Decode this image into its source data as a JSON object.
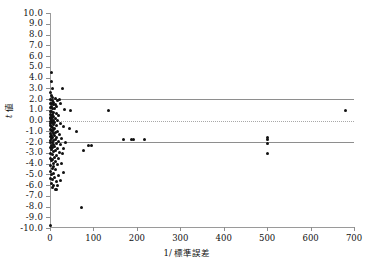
{
  "chart_data": {
    "type": "scatter",
    "title": "",
    "xlabel": "1/ 標準誤差",
    "ylabel": "t 値",
    "xlim": [
      0,
      700
    ],
    "ylim": [
      -10,
      10
    ],
    "xticks": [
      0,
      100,
      200,
      300,
      400,
      500,
      600,
      700
    ],
    "yticks": [
      10.0,
      9.0,
      8.0,
      7.0,
      6.0,
      5.0,
      4.0,
      3.0,
      2.0,
      1.0,
      0.0,
      -1.0,
      -2.0,
      -3.0,
      -4.0,
      -5.0,
      -6.0,
      -7.0,
      -8.0,
      -9.0,
      -10.0
    ],
    "xtick_labels": [
      "0",
      "100",
      "200",
      "300",
      "400",
      "500",
      "600",
      "700"
    ],
    "ytick_labels": [
      "10.0",
      "9.0",
      "8.0",
      "7.0",
      "6.0",
      "5.0",
      "4.0",
      "3.0",
      "2.0",
      "1.0",
      "0.0",
      "-1.0",
      "-2.0",
      "-3.0",
      "-4.0",
      "-5.0",
      "-6.0",
      "-7.0",
      "-8.0",
      "-9.0",
      "-10.0"
    ],
    "grid": false,
    "legend": null,
    "marker": "filled-circle",
    "marker_color": "#111111",
    "reference_lines": [
      {
        "name": "upper-significance-line",
        "y": 1.96,
        "style": "solid",
        "color": "#8e8e8e"
      },
      {
        "name": "zero-line",
        "y": 0.0,
        "style": "dotted",
        "color": "#a8a8a8"
      },
      {
        "name": "lower-significance-line",
        "y": -1.96,
        "style": "solid",
        "color": "#8e8e8e"
      }
    ],
    "points": [
      [
        3,
        4.5
      ],
      [
        4,
        3.6
      ],
      [
        5,
        3.0
      ],
      [
        28,
        3.0
      ],
      [
        2,
        2.6
      ],
      [
        3,
        2.3
      ],
      [
        6,
        2.1
      ],
      [
        13,
        2.05
      ],
      [
        21,
        2.0
      ],
      [
        2,
        1.95
      ],
      [
        5,
        1.9
      ],
      [
        17,
        1.85
      ],
      [
        9,
        1.7
      ],
      [
        1,
        1.6
      ],
      [
        4,
        1.55
      ],
      [
        12,
        1.5
      ],
      [
        24,
        1.6
      ],
      [
        7,
        1.45
      ],
      [
        3,
        1.35
      ],
      [
        16,
        1.3
      ],
      [
        2,
        1.2
      ],
      [
        6,
        1.15
      ],
      [
        11,
        1.1
      ],
      [
        34,
        1.05
      ],
      [
        46,
        0.95
      ],
      [
        135,
        0.9
      ],
      [
        681,
        0.95
      ],
      [
        1,
        0.85
      ],
      [
        4,
        0.8
      ],
      [
        8,
        0.75
      ],
      [
        14,
        0.7
      ],
      [
        2,
        0.6
      ],
      [
        5,
        0.55
      ],
      [
        20,
        0.5
      ],
      [
        3,
        0.45
      ],
      [
        9,
        0.4
      ],
      [
        1,
        0.3
      ],
      [
        6,
        0.25
      ],
      [
        12,
        0.2
      ],
      [
        2,
        0.15
      ],
      [
        4,
        0.1
      ],
      [
        18,
        0.05
      ],
      [
        7,
        0.0
      ],
      [
        1,
        -0.05
      ],
      [
        3,
        -0.1
      ],
      [
        10,
        -0.15
      ],
      [
        5,
        -0.2
      ],
      [
        23,
        -0.25
      ],
      [
        2,
        -0.3
      ],
      [
        8,
        -0.4
      ],
      [
        15,
        -0.45
      ],
      [
        1,
        -0.5
      ],
      [
        4,
        -0.55
      ],
      [
        30,
        -0.6
      ],
      [
        6,
        -0.65
      ],
      [
        11,
        -0.7
      ],
      [
        45,
        -0.75
      ],
      [
        2,
        -0.8
      ],
      [
        9,
        -0.85
      ],
      [
        3,
        -0.95
      ],
      [
        17,
        -1.0
      ],
      [
        60,
        -1.0
      ],
      [
        5,
        -1.05
      ],
      [
        13,
        -1.1
      ],
      [
        1,
        -1.2
      ],
      [
        7,
        -1.25
      ],
      [
        22,
        -1.3
      ],
      [
        4,
        -1.35
      ],
      [
        10,
        -1.4
      ],
      [
        2,
        -1.5
      ],
      [
        16,
        -1.55
      ],
      [
        6,
        -1.6
      ],
      [
        27,
        -1.65
      ],
      [
        3,
        -1.7
      ],
      [
        12,
        -1.75
      ],
      [
        170,
        -1.75
      ],
      [
        188,
        -1.8
      ],
      [
        193,
        -1.78
      ],
      [
        218,
        -1.8
      ],
      [
        500,
        -1.55
      ],
      [
        500,
        -1.75
      ],
      [
        1,
        -1.85
      ],
      [
        8,
        -1.9
      ],
      [
        19,
        -1.95
      ],
      [
        5,
        -2.0
      ],
      [
        35,
        -2.0
      ],
      [
        2,
        -2.05
      ],
      [
        14,
        -2.1
      ],
      [
        500,
        -2.15
      ],
      [
        9,
        -2.2
      ],
      [
        24,
        -2.25
      ],
      [
        4,
        -2.3
      ],
      [
        88,
        -2.35
      ],
      [
        95,
        -2.3
      ],
      [
        11,
        -2.4
      ],
      [
        1,
        -2.5
      ],
      [
        6,
        -2.55
      ],
      [
        18,
        -2.6
      ],
      [
        32,
        -2.6
      ],
      [
        3,
        -2.7
      ],
      [
        78,
        -2.75
      ],
      [
        13,
        -2.8
      ],
      [
        8,
        -2.9
      ],
      [
        22,
        -2.95
      ],
      [
        500,
        -3.05
      ],
      [
        2,
        -3.1
      ],
      [
        29,
        -3.1
      ],
      [
        5,
        -3.2
      ],
      [
        15,
        -3.25
      ],
      [
        10,
        -3.4
      ],
      [
        1,
        -3.5
      ],
      [
        20,
        -3.55
      ],
      [
        6,
        -3.6
      ],
      [
        3,
        -3.75
      ],
      [
        12,
        -3.8
      ],
      [
        7,
        -3.95
      ],
      [
        26,
        -3.95
      ],
      [
        17,
        -4.1
      ],
      [
        2,
        -4.2
      ],
      [
        9,
        -4.3
      ],
      [
        5,
        -4.5
      ],
      [
        13,
        -4.6
      ],
      [
        1,
        -4.75
      ],
      [
        30,
        -4.8
      ],
      [
        8,
        -4.9
      ],
      [
        4,
        -5.0
      ],
      [
        19,
        -5.1
      ],
      [
        11,
        -5.3
      ],
      [
        2,
        -5.4
      ],
      [
        6,
        -5.5
      ],
      [
        24,
        -5.55
      ],
      [
        14,
        -5.7
      ],
      [
        3,
        -5.85
      ],
      [
        9,
        -6.0
      ],
      [
        17,
        -6.05
      ],
      [
        5,
        -6.2
      ],
      [
        12,
        -6.4
      ],
      [
        16,
        -6.45
      ],
      [
        72,
        -8.1
      ],
      [
        1,
        -9.8
      ]
    ]
  },
  "figure": {
    "background": "#ffffff",
    "axis_color": "#9a9a9a",
    "text_color": "#111111"
  }
}
